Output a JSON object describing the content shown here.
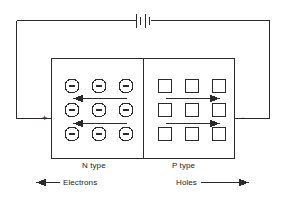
{
  "diagram": {
    "stroke_color": "#2b2b2b",
    "background": "#ffffff",
    "battery": {
      "name": "battery-symbol",
      "plate_count": 4,
      "position": {
        "x": 143,
        "y": 20
      }
    },
    "circuit": {
      "top_wire": "horizontal wire with battery at top",
      "left_wire": "left vertical wire to positive terminal",
      "right_wire": "right vertical wire to negative terminal"
    },
    "terminals": {
      "positive": "+",
      "negative": "−"
    },
    "regions": [
      {
        "id": "n-region",
        "label": "N type",
        "carrier_label": "Electrons",
        "carrier_symbol": "circle-minus",
        "carrier_count": 9,
        "carrier_rows": 3,
        "carrier_cols": 3,
        "arrow_direction": "left",
        "arrow_count": 2
      },
      {
        "id": "p-region",
        "label": "P type",
        "carrier_label": "Holes",
        "carrier_symbol": "square",
        "carrier_count": 9,
        "carrier_rows": 3,
        "carrier_cols": 3,
        "arrow_direction": "right",
        "arrow_count": 2
      }
    ],
    "legend": [
      {
        "label": "Electrons",
        "arrow": "left"
      },
      {
        "label": "Holes",
        "arrow": "right"
      }
    ]
  }
}
